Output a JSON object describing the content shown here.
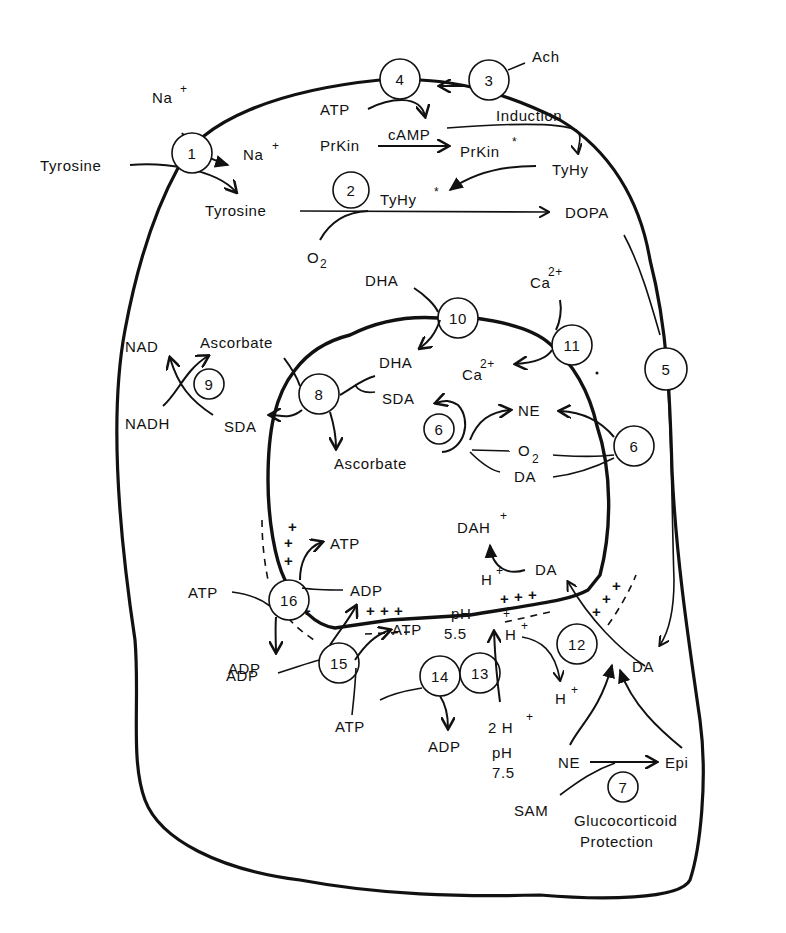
{
  "colors": {
    "ink": "#111111",
    "background": "#ffffff"
  },
  "steps": {
    "s1": "1",
    "s2": "2",
    "s3": "3",
    "s4": "4",
    "s5": "5",
    "s6a": "6",
    "s6b": "6",
    "s7": "7",
    "s8": "8",
    "s9": "9",
    "s10": "10",
    "s11": "11",
    "s12": "12",
    "s13": "13",
    "s14": "14",
    "s15": "15",
    "s16": "16"
  },
  "cytosol": {
    "na_out": "Na",
    "na_in": "Na",
    "plus": "+",
    "tyrosine_out": "Tyrosine",
    "tyrosine_in": "Tyrosine",
    "ach": "Ach",
    "atp": "ATP",
    "camp": "cAMP",
    "induction": "Induction",
    "prkin": "PrKin",
    "prkin_active": "PrKin",
    "star": "*",
    "tyhy": "TyHy",
    "tyhy_active": "TyHy",
    "o2": "O",
    "o2_sub": "2",
    "dopa": "DOPA",
    "nad": "NAD",
    "nadh": "NADH",
    "ascorbate_left": "Ascorbate",
    "sda_left": "SDA",
    "dha_top": "DHA",
    "ca_out": "Ca",
    "ca_sup": "2+",
    "da_right": "DA",
    "ne_bottom": "NE",
    "epi": "Epi",
    "sam": "SAM",
    "glucocorticoid": "Glucocorticoid",
    "protection": "Protection",
    "atp_16": "ATP",
    "adp_16": "ADP",
    "adp_15": "ADP",
    "atp_15": "ATP",
    "adp_14": "ADP",
    "h2": "2 H",
    "ph_out": "pH",
    "ph_out_val": "7.5",
    "h_out": "H"
  },
  "vesicle": {
    "dha": "DHA",
    "sda": "SDA",
    "ascorbate": "Ascorbate",
    "ca_in": "Ca",
    "ne": "NE",
    "o2": "O",
    "o2_sub": "2",
    "da": "DA",
    "dah": "DAH",
    "da_in": "DA",
    "h1": "H",
    "h2": "H",
    "plus_free": "+",
    "ph_in": "pH",
    "ph_in_val": "5.5",
    "atp_top": "ATP",
    "adp_mid": "ADP",
    "atp_mid": "ATP"
  }
}
